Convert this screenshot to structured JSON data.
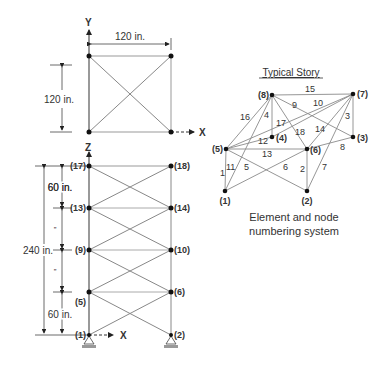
{
  "top_view": {
    "axis_y_label": "Y",
    "axis_x_label": "X",
    "width_dim": "120 in.",
    "height_dim": "120 in."
  },
  "elevation": {
    "axis_z_label": "Z",
    "axis_x_label": "X",
    "total_dim": "240 in.",
    "top_story_dim": "60 in.",
    "bottom_story_dim": "60 in.",
    "ditto_1": "”",
    "ditto_2": "”",
    "nodes_left": [
      "(17)",
      "(13)",
      "(9)",
      "(5)",
      "(1)"
    ],
    "nodes_right": [
      "(18)",
      "(14)",
      "(10)",
      "(6)",
      "(2)"
    ]
  },
  "typical_story": {
    "title": "Typical Story",
    "nodes": {
      "n1": "(1)",
      "n2": "(2)",
      "n3": "(3)",
      "n4": "(4)",
      "n5": "(5)",
      "n6": "(6)",
      "n7": "(7)",
      "n8": "(8)"
    },
    "elements": {
      "e1": "1",
      "e2": "2",
      "e3": "3",
      "e4": "4",
      "e5": "5",
      "e6": "6",
      "e7": "7",
      "e8": "8",
      "e9": "9",
      "e10": "10",
      "e11": "11",
      "e12": "12",
      "e13": "13",
      "e14": "14",
      "e15": "15",
      "e16": "16",
      "e17": "17",
      "e18": "18"
    },
    "caption_line1": "Element and node",
    "caption_line2": "numbering system"
  },
  "colors": {
    "line": "#8a8a8a",
    "frame": "#555555",
    "node": "#111111",
    "text": "#333333"
  }
}
